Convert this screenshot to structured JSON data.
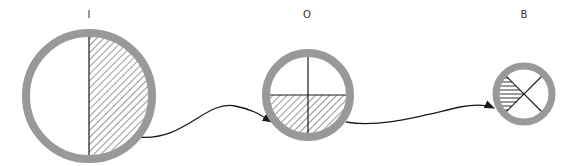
{
  "diagram": {
    "title": "",
    "colors": {
      "ring": "#999999",
      "line": "#1a1a1a",
      "background": "#ffffff"
    },
    "nodes": [
      {
        "id": "I",
        "label": "I",
        "cx": 89,
        "cy": 96,
        "r": 63,
        "ring_width": 8,
        "pattern": "half-vertical",
        "shaded": "right half (diagonal hatch)"
      },
      {
        "id": "O",
        "label": "O",
        "cx": 308,
        "cy": 95,
        "r": 42,
        "ring_width": 8,
        "pattern": "quarters-cross",
        "shaded": "bottom half (diagonal hatch)"
      },
      {
        "id": "B",
        "label": "B",
        "cx": 524,
        "cy": 94,
        "r": 28,
        "ring_width": 7,
        "pattern": "x-quarters",
        "shaded": "left quadrant (horizontal hatch)"
      }
    ],
    "edges": [
      {
        "from": "I",
        "to": "O"
      },
      {
        "from": "O",
        "to": "B"
      }
    ]
  }
}
